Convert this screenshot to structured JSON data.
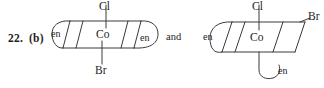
{
  "figure": {
    "question_number": "22.",
    "part_label": "(b)",
    "conjunction": "and",
    "description_type": "coordination-complex-isomer-pair"
  },
  "structures": [
    {
      "id": "isomer-left",
      "geometry": "octahedral-parallelogram",
      "center_atom": "Co",
      "axial_top": "Cl",
      "axial_bottom": "Br",
      "ligand_left": "en",
      "ligand_right": "en"
    },
    {
      "id": "isomer-right",
      "geometry": "octahedral-parallelogram",
      "center_atom": "Co",
      "axial_top": "Cl",
      "equatorial_right": "Br",
      "ligand_left": "en",
      "ligand_bottom": "en"
    }
  ],
  "style": {
    "ink": "#3a3a3a",
    "text": "#1d1d1d",
    "background": "#ffffff"
  }
}
